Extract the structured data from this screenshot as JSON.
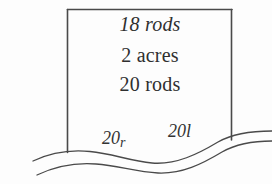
{
  "figure": {
    "kind": "survey-plat-diagram",
    "width": 272,
    "height": 184,
    "background_color": "#fdfdfd",
    "ink_color": "#4a4a4a",
    "text_color": "#2f2f2f"
  },
  "parcel": {
    "measurements": [
      {
        "text": "18 rods",
        "style": "italic"
      },
      {
        "text": "2 acres",
        "style": "roman"
      },
      {
        "text": "20 rods",
        "style": "roman"
      }
    ],
    "line_1": "18 rods",
    "line_2": "2 acres",
    "line_3": "20 rods"
  },
  "frontage": {
    "left": {
      "value": "20",
      "unit": "r"
    },
    "right": {
      "value": "20",
      "unit": "l"
    }
  },
  "boundary": {
    "top_label": "north boundary",
    "left_label": "west boundary",
    "right_label": "east boundary",
    "open_side": "south"
  },
  "river": {
    "label": "watercourse",
    "line_count": 2
  }
}
